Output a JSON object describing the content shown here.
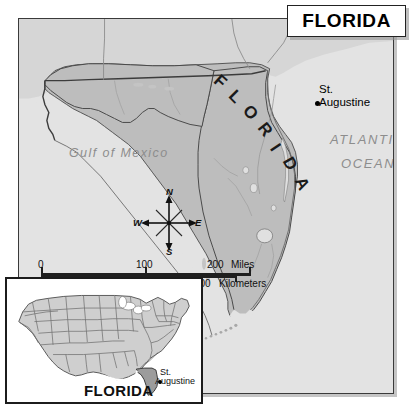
{
  "map": {
    "title": "FLORIDA",
    "labels": {
      "state_name": "FLORIDA",
      "gulf": "Gulf of Mexico",
      "ocean_line1": "ATLANTIC",
      "ocean_line2": "OCEAN",
      "city_line1": "St.",
      "city_line2": "Augustine"
    },
    "compass": {
      "north": "N",
      "east": "E",
      "south": "S",
      "west": "W"
    },
    "scale": {
      "miles_ticks": [
        "0",
        "100",
        "200"
      ],
      "miles_unit": "Miles",
      "km_ticks": [
        "0",
        "100",
        "200",
        "300"
      ],
      "km_unit": "Kilometers"
    }
  },
  "inset": {
    "state_label": "FLORIDA",
    "city_line1": "St.",
    "city_line2": "Augustine"
  },
  "colors": {
    "ocean": "#e3e3e3",
    "land_neighbor": "#d4d4d4",
    "land_state": "#bcbcbc",
    "border": "#3a3a3a",
    "water_text": "#8d8d8d",
    "ink": "#101010"
  }
}
